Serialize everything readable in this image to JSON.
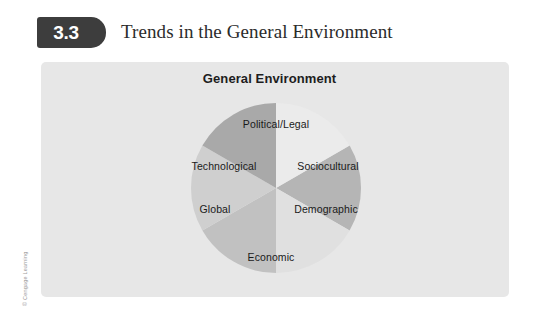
{
  "exhibit": {
    "vertical_label": "EXHIBIT",
    "number": "3.3",
    "title": "Trends in the General Environment",
    "copyright": "© Cengage Learning"
  },
  "panel": {
    "heading": "General Environment",
    "background_color": "#e7e7e7"
  },
  "chart_data": {
    "type": "pie",
    "title": "General Environment",
    "legend_position": "none",
    "grid": false,
    "categories": [
      "Political/Legal",
      "Sociocultural",
      "Demographic",
      "Economic",
      "Global",
      "Technological"
    ],
    "values": [
      1,
      1,
      1,
      1,
      1,
      1
    ],
    "slice_degrees": [
      60,
      60,
      60,
      60,
      60,
      60
    ],
    "start_angle_deg": -30,
    "colors": [
      "#b5b5b5",
      "#e0e0e0",
      "#c1c1c1",
      "#cfcfcf",
      "#a9a9a9",
      "#ebebeb"
    ],
    "segments": [
      {
        "label": "Political/Legal",
        "color": "#b5b5b5",
        "degrees": 60
      },
      {
        "label": "Sociocultural",
        "color": "#e0e0e0",
        "degrees": 60
      },
      {
        "label": "Demographic",
        "color": "#c1c1c1",
        "degrees": 60
      },
      {
        "label": "Economic",
        "color": "#cfcfcf",
        "degrees": 60
      },
      {
        "label": "Global",
        "color": "#a9a9a9",
        "degrees": 60
      },
      {
        "label": "Technological",
        "color": "#ebebeb",
        "degrees": 60
      }
    ]
  }
}
